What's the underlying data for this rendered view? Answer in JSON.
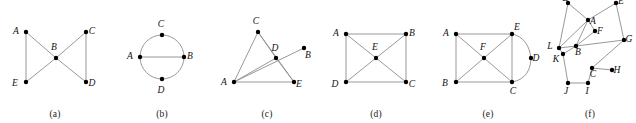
{
  "figure": {
    "width": 636,
    "height": 123,
    "background": "#ffffff",
    "edge_color": "#8d8d8d",
    "node_color": "#000000",
    "label_color": "#111111"
  },
  "panels": [
    {
      "id": "a",
      "caption": "(a)",
      "x": 0,
      "width": 110,
      "vertices": [
        {
          "name": "A",
          "cx": 26,
          "cy": 32,
          "label_dx": -10,
          "label_dy": 2
        },
        {
          "name": "B",
          "cx": 56,
          "cy": 58,
          "label_dx": -2,
          "label_dy": -8
        },
        {
          "name": "C",
          "cx": 86,
          "cy": 32,
          "label_dx": 6,
          "label_dy": 2
        },
        {
          "name": "D",
          "cx": 86,
          "cy": 82,
          "label_dx": 6,
          "label_dy": 4
        },
        {
          "name": "E",
          "cx": 26,
          "cy": 82,
          "label_dx": -11,
          "label_dy": 4
        }
      ],
      "edges": [
        {
          "from": "A",
          "to": "E"
        },
        {
          "from": "A",
          "to": "B"
        },
        {
          "from": "B",
          "to": "E"
        },
        {
          "from": "B",
          "to": "C"
        },
        {
          "from": "B",
          "to": "D"
        },
        {
          "from": "C",
          "to": "D"
        }
      ],
      "arcs": []
    },
    {
      "id": "b",
      "caption": "(b)",
      "x": 110,
      "width": 104,
      "vertices": [
        {
          "name": "A",
          "cx": 30,
          "cy": 57,
          "label_dx": -10,
          "label_dy": 2
        },
        {
          "name": "B",
          "cx": 74,
          "cy": 57,
          "label_dx": 6,
          "label_dy": 2
        },
        {
          "name": "C",
          "cx": 52,
          "cy": 35,
          "label_dx": -1,
          "label_dy": -8
        },
        {
          "name": "D",
          "cx": 52,
          "cy": 79,
          "label_dx": -1,
          "label_dy": 14
        }
      ],
      "edges": [
        {
          "from": "A",
          "to": "B"
        }
      ],
      "arcs": [
        {
          "type": "circle",
          "cx": 52,
          "cy": 57,
          "r": 22
        }
      ]
    },
    {
      "id": "c",
      "caption": "(c)",
      "x": 214,
      "width": 106,
      "vertices": [
        {
          "name": "A",
          "cx": 20,
          "cy": 82,
          "label_dx": -10,
          "label_dy": 3
        },
        {
          "name": "B",
          "cx": 90,
          "cy": 48,
          "label_dx": 4,
          "label_dy": 10
        },
        {
          "name": "C",
          "cx": 44,
          "cy": 32,
          "label_dx": -2,
          "label_dy": -8
        },
        {
          "name": "D",
          "cx": 62,
          "cy": 58,
          "label_dx": -1,
          "label_dy": -7
        },
        {
          "name": "E",
          "cx": 80,
          "cy": 82,
          "label_dx": 5,
          "label_dy": 5
        }
      ],
      "edges": [
        {
          "from": "A",
          "to": "C"
        },
        {
          "from": "A",
          "to": "E"
        },
        {
          "from": "A",
          "to": "D"
        },
        {
          "from": "A",
          "to": "B"
        },
        {
          "from": "C",
          "to": "D"
        },
        {
          "from": "C",
          "to": "E"
        },
        {
          "from": "D",
          "to": "E"
        }
      ],
      "arcs": []
    },
    {
      "id": "d",
      "caption": "(d)",
      "x": 320,
      "width": 112,
      "vertices": [
        {
          "name": "A",
          "cx": 26,
          "cy": 34,
          "label_dx": -10,
          "label_dy": 2
        },
        {
          "name": "B",
          "cx": 86,
          "cy": 34,
          "label_dx": 6,
          "label_dy": 2
        },
        {
          "name": "C",
          "cx": 86,
          "cy": 82,
          "label_dx": 6,
          "label_dy": 5
        },
        {
          "name": "D",
          "cx": 26,
          "cy": 82,
          "label_dx": -11,
          "label_dy": 5
        },
        {
          "name": "E",
          "cx": 56,
          "cy": 58,
          "label_dx": -1,
          "label_dy": -8
        }
      ],
      "edges": [
        {
          "from": "A",
          "to": "B"
        },
        {
          "from": "B",
          "to": "C"
        },
        {
          "from": "C",
          "to": "D"
        },
        {
          "from": "D",
          "to": "A"
        },
        {
          "from": "A",
          "to": "E"
        },
        {
          "from": "B",
          "to": "E"
        },
        {
          "from": "C",
          "to": "E"
        },
        {
          "from": "D",
          "to": "E"
        }
      ],
      "arcs": []
    },
    {
      "id": "e",
      "caption": "(e)",
      "x": 432,
      "width": 112,
      "vertices": [
        {
          "name": "A",
          "cx": 24,
          "cy": 34,
          "label_dx": -10,
          "label_dy": 2
        },
        {
          "name": "E",
          "cx": 80,
          "cy": 34,
          "label_dx": 5,
          "label_dy": -4
        },
        {
          "name": "B",
          "cx": 24,
          "cy": 82,
          "label_dx": -11,
          "label_dy": 4
        },
        {
          "name": "C",
          "cx": 80,
          "cy": 82,
          "label_dx": 1,
          "label_dy": 12
        },
        {
          "name": "F",
          "cx": 52,
          "cy": 58,
          "label_dx": -1,
          "label_dy": -8
        },
        {
          "name": "D",
          "cx": 99,
          "cy": 58,
          "label_dx": 5,
          "label_dy": 3
        }
      ],
      "edges": [
        {
          "from": "A",
          "to": "E"
        },
        {
          "from": "A",
          "to": "B"
        },
        {
          "from": "B",
          "to": "C"
        },
        {
          "from": "E",
          "to": "C"
        },
        {
          "from": "A",
          "to": "F"
        },
        {
          "from": "B",
          "to": "F"
        },
        {
          "from": "E",
          "to": "F"
        },
        {
          "from": "C",
          "to": "F"
        }
      ],
      "arcs": [
        {
          "type": "path",
          "d": "M 80 34 C 103 38 107 78 80 82"
        }
      ]
    },
    {
      "id": "f",
      "caption": "(f)",
      "x": 544,
      "width": 92,
      "vertices": [
        {
          "name": "D",
          "cx": 24,
          "cy": 3,
          "label_dx": -2,
          "label_dy": -2
        },
        {
          "name": "E",
          "cx": 72,
          "cy": 3,
          "label_dx": 5,
          "label_dy": 1
        },
        {
          "name": "A",
          "cx": 44,
          "cy": 20,
          "label_dx": 5,
          "label_dy": 4
        },
        {
          "name": "F",
          "cx": 51,
          "cy": 31,
          "label_dx": 5,
          "label_dy": 3
        },
        {
          "name": "G",
          "cx": 80,
          "cy": 40,
          "label_dx": 5,
          "label_dy": 2
        },
        {
          "name": "L",
          "cx": 15,
          "cy": 48,
          "label_dx": -9,
          "label_dy": 1
        },
        {
          "name": "B",
          "cx": 32,
          "cy": 46,
          "label_dx": 2,
          "label_dy": 9
        },
        {
          "name": "K",
          "cx": 19,
          "cy": 54,
          "label_dx": -7,
          "label_dy": 8
        },
        {
          "name": "C",
          "cx": 48,
          "cy": 68,
          "label_dx": 1,
          "label_dy": 9
        },
        {
          "name": "H",
          "cx": 68,
          "cy": 70,
          "label_dx": 5,
          "label_dy": 3
        },
        {
          "name": "J",
          "cx": 24,
          "cy": 83,
          "label_dx": -2,
          "label_dy": 11
        },
        {
          "name": "I",
          "cx": 44,
          "cy": 83,
          "label_dx": -1,
          "label_dy": 11
        }
      ],
      "edges": [
        {
          "from": "D",
          "to": "A"
        },
        {
          "from": "E",
          "to": "A"
        },
        {
          "from": "A",
          "to": "F"
        },
        {
          "from": "A",
          "to": "B"
        },
        {
          "from": "A",
          "to": "L"
        },
        {
          "from": "F",
          "to": "B"
        },
        {
          "from": "L",
          "to": "B"
        },
        {
          "from": "L",
          "to": "K"
        },
        {
          "from": "K",
          "to": "B"
        },
        {
          "from": "B",
          "to": "G"
        },
        {
          "from": "G",
          "to": "C"
        },
        {
          "from": "C",
          "to": "H"
        },
        {
          "from": "C",
          "to": "I"
        },
        {
          "from": "I",
          "to": "J"
        },
        {
          "from": "J",
          "to": "K"
        },
        {
          "from": "E",
          "to": "G"
        },
        {
          "from": "D",
          "to": "L"
        }
      ],
      "arcs": []
    }
  ]
}
